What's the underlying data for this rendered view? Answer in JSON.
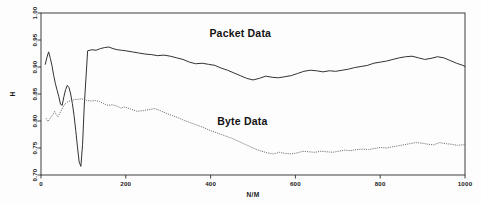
{
  "chart_data": {
    "type": "line",
    "title": "",
    "xlabel": "N/M",
    "ylabel": "H",
    "xlim": [
      0,
      1000
    ],
    "ylim": [
      0.7,
      1.0
    ],
    "grid": false,
    "legend_position": "inline-annotation",
    "xticks": [
      "0",
      "200",
      "400",
      "600",
      "800",
      "1000"
    ],
    "xtick_values": [
      0,
      200,
      400,
      600,
      800,
      1000
    ],
    "yticks": [
      "1.00",
      "0.95",
      "0.90",
      "0.85",
      "0.80",
      "0.75",
      "0.70"
    ],
    "ytick_values": [
      1.0,
      0.95,
      0.9,
      0.85,
      0.8,
      0.75,
      0.7
    ],
    "annotations": [
      {
        "text": "Packet Data",
        "x": 470,
        "y": 0.955
      },
      {
        "text": "Byte Data",
        "x": 475,
        "y": 0.792
      }
    ],
    "series": [
      {
        "name": "Packet Data",
        "style": "solid",
        "color": "#333333",
        "x": [
          10,
          14,
          18,
          22,
          26,
          30,
          34,
          38,
          42,
          46,
          50,
          54,
          58,
          62,
          66,
          70,
          74,
          78,
          82,
          86,
          90,
          94,
          98,
          102,
          110,
          120,
          130,
          140,
          150,
          160,
          170,
          180,
          190,
          200,
          215,
          230,
          245,
          260,
          275,
          290,
          305,
          320,
          335,
          350,
          365,
          380,
          395,
          410,
          425,
          440,
          455,
          470,
          485,
          500,
          515,
          530,
          545,
          560,
          575,
          590,
          605,
          620,
          635,
          650,
          665,
          680,
          695,
          710,
          725,
          740,
          755,
          770,
          785,
          800,
          815,
          830,
          845,
          860,
          875,
          890,
          905,
          920,
          935,
          950,
          965,
          980,
          995,
          1000
        ],
        "y": [
          0.905,
          0.918,
          0.928,
          0.916,
          0.902,
          0.884,
          0.869,
          0.857,
          0.845,
          0.831,
          0.829,
          0.845,
          0.858,
          0.866,
          0.862,
          0.85,
          0.832,
          0.81,
          0.782,
          0.752,
          0.724,
          0.716,
          0.756,
          0.828,
          0.93,
          0.932,
          0.931,
          0.934,
          0.936,
          0.937,
          0.934,
          0.932,
          0.931,
          0.93,
          0.928,
          0.926,
          0.924,
          0.923,
          0.921,
          0.922,
          0.92,
          0.917,
          0.914,
          0.909,
          0.906,
          0.907,
          0.905,
          0.903,
          0.898,
          0.894,
          0.889,
          0.884,
          0.879,
          0.876,
          0.879,
          0.883,
          0.881,
          0.88,
          0.882,
          0.884,
          0.888,
          0.892,
          0.894,
          0.893,
          0.891,
          0.893,
          0.892,
          0.894,
          0.896,
          0.899,
          0.901,
          0.903,
          0.907,
          0.909,
          0.911,
          0.914,
          0.917,
          0.919,
          0.92,
          0.917,
          0.914,
          0.916,
          0.919,
          0.917,
          0.912,
          0.907,
          0.903,
          0.901
        ]
      },
      {
        "name": "Byte Data",
        "style": "dotted",
        "color": "#555555",
        "x": [
          12,
          16,
          20,
          24,
          28,
          32,
          36,
          40,
          44,
          48,
          52,
          56,
          60,
          64,
          68,
          72,
          76,
          80,
          84,
          88,
          92,
          96,
          100,
          108,
          118,
          128,
          138,
          148,
          158,
          168,
          178,
          188,
          198,
          212,
          226,
          240,
          254,
          268,
          282,
          296,
          310,
          324,
          338,
          352,
          366,
          380,
          394,
          408,
          422,
          436,
          450,
          464,
          478,
          492,
          506,
          520,
          534,
          548,
          562,
          576,
          590,
          604,
          618,
          632,
          646,
          660,
          674,
          688,
          702,
          716,
          730,
          744,
          758,
          772,
          786,
          800,
          814,
          828,
          842,
          856,
          870,
          884,
          898,
          912,
          926,
          940,
          954,
          968,
          982,
          996,
          1000
        ],
        "y": [
          0.805,
          0.799,
          0.803,
          0.808,
          0.812,
          0.818,
          0.812,
          0.808,
          0.814,
          0.82,
          0.826,
          0.831,
          0.834,
          0.836,
          0.837,
          0.838,
          0.839,
          0.84,
          0.84,
          0.84,
          0.841,
          0.841,
          0.84,
          0.838,
          0.837,
          0.838,
          0.836,
          0.832,
          0.829,
          0.83,
          0.828,
          0.824,
          0.826,
          0.822,
          0.818,
          0.819,
          0.821,
          0.823,
          0.819,
          0.814,
          0.81,
          0.806,
          0.801,
          0.797,
          0.793,
          0.789,
          0.784,
          0.78,
          0.776,
          0.772,
          0.768,
          0.763,
          0.758,
          0.753,
          0.748,
          0.744,
          0.741,
          0.739,
          0.742,
          0.74,
          0.739,
          0.741,
          0.744,
          0.743,
          0.742,
          0.744,
          0.743,
          0.742,
          0.744,
          0.746,
          0.745,
          0.747,
          0.748,
          0.747,
          0.749,
          0.751,
          0.75,
          0.752,
          0.754,
          0.756,
          0.758,
          0.76,
          0.759,
          0.757,
          0.756,
          0.76,
          0.758,
          0.757,
          0.755,
          0.756,
          0.756
        ]
      }
    ]
  }
}
